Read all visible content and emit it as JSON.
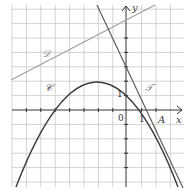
{
  "figure": {
    "labels": {
      "curve_C": "𝒞",
      "line_D": "𝒟",
      "tangent_T": "𝒯",
      "point_A": "A",
      "x_axis": "x",
      "y_axis": "y",
      "origin": "0",
      "x_unit": "1",
      "y_unit": "1"
    },
    "colors": {
      "grid": "#c8c8c8",
      "axes": "#333333",
      "curve": "#3a3a3a",
      "line_D": "#a0a0a0",
      "tangent": "#555555"
    },
    "curve_C": {
      "type": "parabola",
      "vertex": [
        -2,
        4.5
      ],
      "a": -0.4
    },
    "line_D": {
      "through": [
        [
          -8.0,
          2.1
        ],
        [
          2.0,
          7.3
        ]
      ]
    },
    "tangent_T": {
      "through": [
        [
          1.35,
          0
        ],
        [
          -2,
          9.0
        ]
      ]
    },
    "point_A": [
      1.35,
      0
    ],
    "x_range": [
      -8,
      4
    ],
    "y_range": [
      -5,
      7
    ]
  }
}
